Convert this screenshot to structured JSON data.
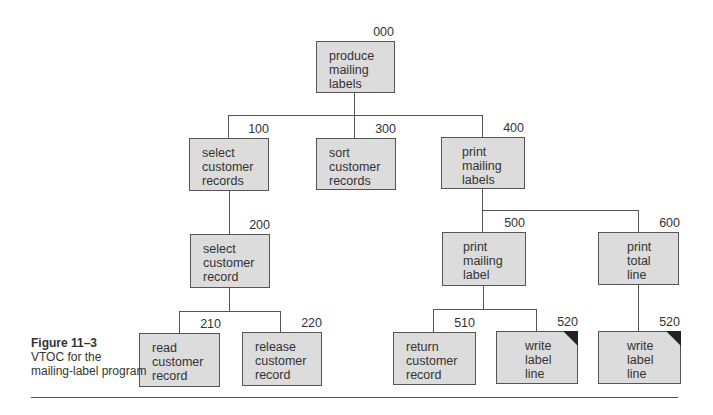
{
  "diagram": {
    "type": "VTOC hierarchy chart",
    "modules": [
      {
        "id": "000",
        "label": "produce\nmailing\nlabels"
      },
      {
        "id": "100",
        "label": "select\ncustomer\nrecords"
      },
      {
        "id": "300",
        "label": "sort\ncustomer\nrecords"
      },
      {
        "id": "400",
        "label": "print\nmailing\nlabels"
      },
      {
        "id": "200",
        "label": "select\ncustomer\nrecord"
      },
      {
        "id": "500",
        "label": "print\nmailing\nlabel"
      },
      {
        "id": "600",
        "label": "print\ntotal\nline"
      },
      {
        "id": "210",
        "label": "read\ncustomer\nrecord"
      },
      {
        "id": "220",
        "label": "release\ncustomer\nrecord"
      },
      {
        "id": "510",
        "label": "return\ncustomer\nrecord"
      },
      {
        "id": "520",
        "label": "write\nlabel\nline"
      },
      {
        "id": "520",
        "label": "write\nlabel\nline"
      }
    ]
  },
  "caption": {
    "figure": "Figure 11–3",
    "text": "VTOC for the\nmailing-label program"
  }
}
